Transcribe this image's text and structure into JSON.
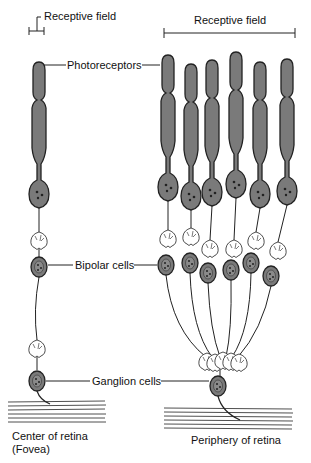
{
  "diagram": {
    "labels": {
      "receptive_field_left": "Receptive field",
      "receptive_field_right": "Receptive field",
      "photoreceptors": "Photoreceptors",
      "bipolar_cells": "Bipolar cells",
      "ganglion_cells": "Ganglion cells"
    },
    "captions": {
      "left_line1": "Center of retina",
      "left_line2": "(Fovea)",
      "right": "Periphery of retina"
    },
    "colors": {
      "cell_fill": "#7a7a7a",
      "outline": "#222222",
      "background": "#ffffff"
    },
    "counts": {
      "fovea_photoreceptors": 1,
      "fovea_bipolar": 1,
      "fovea_ganglion": 1,
      "periphery_photoreceptors": 6,
      "periphery_bipolar": 6,
      "periphery_ganglion": 1
    }
  }
}
